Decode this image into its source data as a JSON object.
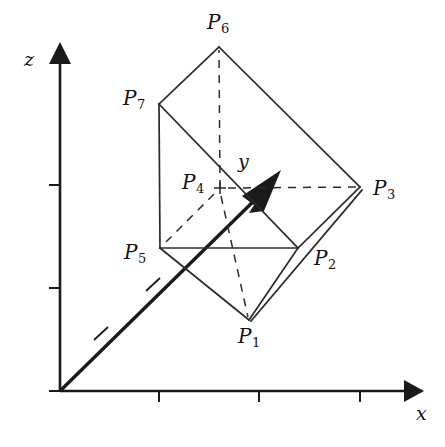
{
  "figure": {
    "background_color": "#ffffff",
    "stroke_color": "#1a1a1a",
    "axes": {
      "origin": {
        "x": 60,
        "y": 391
      },
      "x_axis": {
        "label": "x",
        "label_pos": {
          "x": 418,
          "y": 414
        },
        "tip": {
          "x": 420,
          "y": 391
        },
        "ticks": [
          159,
          259,
          360
        ]
      },
      "z_axis": {
        "label": "z",
        "label_pos": {
          "x": 24,
          "y": 57
        },
        "tip": {
          "x": 60,
          "y": 45
        },
        "ticks": [
          288,
          185
        ]
      },
      "y_axis": {
        "label": "y",
        "label_pos": {
          "x": 238,
          "y": 155
        },
        "tip": {
          "x": 281,
          "y": 170
        },
        "ticks": [
          {
            "x": 100,
            "y": 334
          },
          {
            "x": 152,
            "y": 285
          }
        ]
      }
    },
    "vertices": [
      {
        "name": "P1",
        "label": "P",
        "sub": "1",
        "x": 249,
        "y": 320,
        "label_x": 243,
        "label_y": 328
      },
      {
        "name": "P2",
        "label": "P",
        "sub": "2",
        "x": 298,
        "y": 248,
        "label_x": 314,
        "label_y": 250
      },
      {
        "name": "P3",
        "label": "P",
        "sub": "3",
        "x": 360,
        "y": 187,
        "label_x": 374,
        "label_y": 180
      },
      {
        "name": "P4",
        "label": "P",
        "sub": "4",
        "x": 220,
        "y": 188,
        "label_x": 182,
        "label_y": 173
      },
      {
        "name": "P5",
        "label": "P",
        "sub": "5",
        "x": 160,
        "y": 248,
        "label_x": 125,
        "label_y": 243
      },
      {
        "name": "P6",
        "label": "P",
        "sub": "6",
        "x": 219,
        "y": 47,
        "label_x": 208,
        "label_y": 14
      },
      {
        "name": "P7",
        "label": "P",
        "sub": "7",
        "x": 159,
        "y": 104,
        "label_x": 124,
        "label_y": 89
      }
    ],
    "solid_edges": [
      {
        "from": "P7",
        "to": "P6"
      },
      {
        "from": "P6",
        "to": "P3"
      },
      {
        "from": "P7",
        "to": "P5"
      },
      {
        "from": "P7",
        "to": "P2"
      },
      {
        "from": "P5",
        "to": "P2"
      },
      {
        "from": "P5",
        "to": "P1"
      },
      {
        "from": "P1",
        "to": "P2"
      },
      {
        "from": "P1",
        "to": "P3"
      },
      {
        "from": "P2",
        "to": "P3"
      }
    ],
    "dashed_edges": [
      {
        "from": "P4",
        "to": "P6"
      },
      {
        "from": "P4",
        "to": "P3"
      },
      {
        "from": "P4",
        "to": "P1"
      },
      {
        "from": "P4",
        "to": "P5"
      }
    ]
  }
}
